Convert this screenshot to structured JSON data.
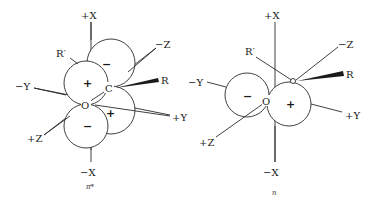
{
  "figure": {
    "panels": [
      {
        "id": "pi-star",
        "caption": "π*",
        "axes": {
          "plus_x": "+X",
          "minus_x": "−X",
          "plus_y": "+Y",
          "minus_y": "−Y",
          "plus_z": "+Z",
          "minus_z": "−Z"
        },
        "atoms": {
          "carbon": "C",
          "oxygen": "O"
        },
        "substituents": {
          "r": "R",
          "r_prime": "R′"
        },
        "lobe_signs": {
          "o_upper": "+",
          "o_lower": "−",
          "c_upper": "−",
          "c_lower": "+"
        }
      },
      {
        "id": "n",
        "caption": "n",
        "axes": {
          "plus_x": "+X",
          "minus_x": "−X",
          "plus_y": "+Y",
          "minus_y": "−Y",
          "plus_z": "+Z",
          "minus_z": "−Z"
        },
        "atoms": {
          "carbon": "C",
          "oxygen": "O"
        },
        "substituents": {
          "r": "R",
          "r_prime": "R′"
        },
        "lobe_signs": {
          "left": "−",
          "right": "+"
        }
      }
    ]
  }
}
